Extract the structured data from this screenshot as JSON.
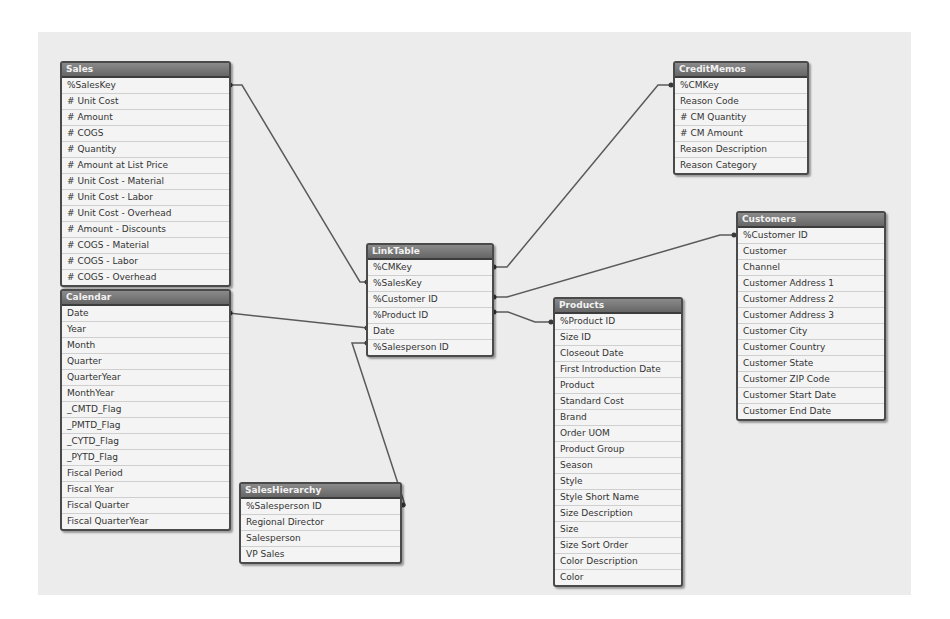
{
  "colors": {
    "canvas_bg": "#ececec",
    "header_bg": "#777777",
    "header_text": "#f2f2f2",
    "border": "#4a4a4a",
    "link_line": "#5a5a5a",
    "row_bg": "#f4f4f4"
  },
  "tables": {
    "sales": {
      "title": "Sales",
      "fields": [
        "%SalesKey",
        "# Unit Cost",
        "# Amount",
        "# COGS",
        "# Quantity",
        "# Amount at List Price",
        "# Unit Cost - Material",
        "# Unit Cost - Labor",
        "# Unit Cost - Overhead",
        "# Amount - Discounts",
        "# COGS - Material",
        "# COGS - Labor",
        "# COGS - Overhead"
      ]
    },
    "calendar": {
      "title": "Calendar",
      "fields": [
        "Date",
        "Year",
        "Month",
        "Quarter",
        "QuarterYear",
        "MonthYear",
        "_CMTD_Flag",
        "_PMTD_Flag",
        "_CYTD_Flag",
        "_PYTD_Flag",
        "Fiscal Period",
        "Fiscal Year",
        "Fiscal Quarter",
        "Fiscal QuarterYear"
      ]
    },
    "linktable": {
      "title": "LinkTable",
      "fields": [
        "%CMKey",
        "%SalesKey",
        "%Customer ID",
        "%Product ID",
        "Date",
        "%Salesperson ID"
      ]
    },
    "creditmemos": {
      "title": "CreditMemos",
      "fields": [
        "%CMKey",
        "Reason Code",
        "# CM Quantity",
        "# CM Amount",
        "Reason Description",
        "Reason Category"
      ]
    },
    "customers": {
      "title": "Customers",
      "fields": [
        "%Customer ID",
        "Customer",
        "Channel",
        "Customer Address 1",
        "Customer Address 2",
        "Customer Address 3",
        "Customer City",
        "Customer Country",
        "Customer State",
        "Customer ZIP Code",
        "Customer Start Date",
        "Customer End Date"
      ]
    },
    "products": {
      "title": "Products",
      "fields": [
        "%Product ID",
        "Size ID",
        "Closeout Date",
        "First Introduction Date",
        "Product",
        "Standard Cost",
        "Brand",
        "Order UOM",
        "Product Group",
        "Season",
        "Style",
        "Style Short Name",
        "Size Description",
        "Size",
        "Size Sort Order",
        "Color Description",
        "Color"
      ]
    },
    "saleshierarchy": {
      "title": "SalesHierarchy",
      "fields": [
        "%Salesperson ID",
        "Regional Director",
        "Salesperson",
        "VP Sales"
      ]
    }
  },
  "links": [
    {
      "from": "Sales.%SalesKey",
      "to": "LinkTable.%SalesKey"
    },
    {
      "from": "Calendar.Date",
      "to": "LinkTable.Date"
    },
    {
      "from": "LinkTable.%CMKey",
      "to": "CreditMemos.%CMKey"
    },
    {
      "from": "LinkTable.%Customer ID",
      "to": "Customers.%Customer ID"
    },
    {
      "from": "LinkTable.%Product ID",
      "to": "Products.%Product ID"
    },
    {
      "from": "LinkTable.%Salesperson ID",
      "to": "SalesHierarchy.%Salesperson ID"
    }
  ]
}
